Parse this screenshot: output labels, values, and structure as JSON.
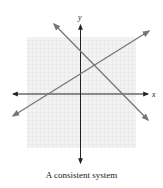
{
  "caption": "A consistent system",
  "axes": {
    "x_label": "x",
    "y_label": "y"
  },
  "colors": {
    "background": "#ffffff",
    "grid_fill": "#f3f3f3",
    "grid_line": "#e2e2e2",
    "axis": "#222222",
    "line": "#777777"
  },
  "lines": [
    {
      "name": "rising-line",
      "slope_sign": "positive",
      "description": "Line with positive slope, arrows at both ends"
    },
    {
      "name": "falling-line",
      "slope_sign": "negative",
      "description": "Line with negative slope, arrows at both ends"
    }
  ],
  "intersection": {
    "description": "Lines intersect at a single point in quadrant I"
  }
}
